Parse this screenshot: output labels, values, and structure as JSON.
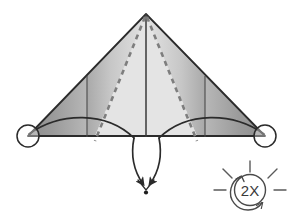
{
  "diagram": {
    "type": "paper-folding-instruction",
    "background_color": "#ffffff",
    "line_color": "#2b2b2b",
    "fold_line_color": "#4a4a4a",
    "dashed_line_color": "#8a8a8a",
    "shading": {
      "light_gray": "#e2e2e2",
      "mid_gray": "#b4b4b4",
      "dark_gray": "#8e8e8e",
      "edge_gray": "#777777"
    }
  },
  "shape": {
    "name": "triangle",
    "apex": {
      "x": 146,
      "y": 14
    },
    "left_corner": {
      "x": 28,
      "y": 136
    },
    "right_corner": {
      "x": 265,
      "y": 136
    },
    "baseline_y": 136
  },
  "fold_lines": {
    "center_vertical": {
      "x": 146,
      "y_top": 14,
      "y_bottom": 136
    },
    "left_vertical": {
      "x": 87,
      "y_top": 76,
      "y_bottom": 136
    },
    "right_vertical": {
      "x": 205,
      "y_top": 76,
      "y_bottom": 136
    },
    "dashed_left": {
      "x1": 146,
      "y1": 16,
      "x2": 95,
      "y2": 140
    },
    "dashed_right": {
      "x1": 146,
      "y1": 16,
      "x2": 197,
      "y2": 140
    }
  },
  "arrows": {
    "left_arc_label": "fold-left-flap-down",
    "right_arc_label": "fold-right-flap-down",
    "convergence_point": {
      "x": 146,
      "y": 188
    },
    "left_start": {
      "x": 30,
      "y": 134
    },
    "right_start": {
      "x": 263,
      "y": 134
    }
  },
  "markers": {
    "left_circle": {
      "cx": 28,
      "cy": 136,
      "r": 11
    },
    "right_circle": {
      "cx": 265,
      "cy": 136,
      "r": 11
    },
    "convergence_dot": {
      "cx": 146,
      "cy": 192,
      "r": 2
    }
  },
  "badge": {
    "label": "2X",
    "meaning": "repeat-twice",
    "center": {
      "x": 250,
      "y": 190
    },
    "radius": 16,
    "ray_count": 5,
    "has_rotation_arrow": true,
    "text_color": "#3a3a3a",
    "outline_color": "#4a4a4a"
  }
}
